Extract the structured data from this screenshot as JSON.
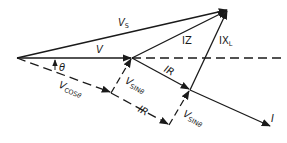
{
  "diagram": {
    "color": "#1a1a1a",
    "labels": {
      "vs": {
        "main": "V",
        "sub": "S"
      },
      "v": {
        "main": "V"
      },
      "iz": {
        "main": "IZ"
      },
      "ixl": {
        "main": "IX",
        "sub": "L"
      },
      "theta": {
        "main": "θ"
      },
      "ir_solid": {
        "main": "IR"
      },
      "ir_dashed": {
        "main": "IR"
      },
      "vsin_upper": {
        "main": "V",
        "sub": "SIN",
        "sub2": "θ"
      },
      "vsin_lower": {
        "main": "V",
        "sub": "SIN",
        "sub2": "θ"
      },
      "vcos": {
        "main": "V",
        "sub": "COS",
        "sub2": "θ"
      },
      "i": {
        "main": "I"
      }
    }
  }
}
